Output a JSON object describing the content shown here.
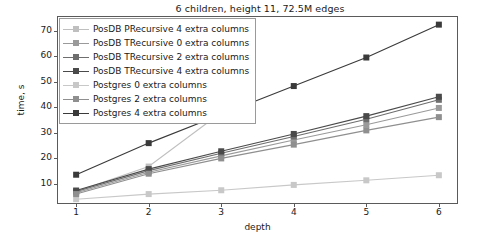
{
  "chart_data": {
    "type": "line",
    "title": "6 children, height 11, 72.5M edges",
    "xlabel": "depth",
    "ylabel": "time, s",
    "x": [
      1,
      2,
      3,
      4,
      5,
      6
    ],
    "xticklabels": [
      "1",
      "2",
      "3",
      "4",
      "5",
      "6"
    ],
    "yticklabels": [
      "10",
      "20",
      "30",
      "40",
      "50",
      "60",
      "70"
    ],
    "yticks": [
      10,
      20,
      30,
      40,
      50,
      60,
      70
    ],
    "xlim": [
      0.75,
      6.25
    ],
    "ylim": [
      2.5,
      75.5
    ],
    "grid": false,
    "legend_position": "upper left",
    "marker": "square",
    "series": [
      {
        "name": "PosDB PRecursive 4 extra columns",
        "color": "#bfbfbf",
        "values": [
          7.0,
          16.8,
          38.0,
          null,
          null,
          null
        ]
      },
      {
        "name": "PosDB TRecursive 0 extra columns",
        "color": "#9a9a9a",
        "values": [
          6.5,
          14.6,
          21.0,
          27.2,
          33.2,
          39.8
        ]
      },
      {
        "name": "PosDB TRecursive 2 extra columns",
        "color": "#6e6e6e",
        "values": [
          7.0,
          15.2,
          22.0,
          28.6,
          35.4,
          43.0
        ]
      },
      {
        "name": "PosDB TRecursive 4 extra columns",
        "color": "#4a4a4a",
        "values": [
          7.4,
          15.8,
          22.8,
          29.6,
          36.6,
          44.2
        ]
      },
      {
        "name": "Postgres 0 extra columns",
        "color": "#c8c8c8",
        "values": [
          4.0,
          6.0,
          7.5,
          9.6,
          11.4,
          13.4
        ]
      },
      {
        "name": "Postgres 2 extra columns",
        "color": "#8f8f8f",
        "values": [
          6.0,
          14.0,
          20.0,
          25.4,
          31.0,
          36.2
        ]
      },
      {
        "name": "Postgres 4 extra columns",
        "color": "#3a3a3a",
        "values": [
          13.6,
          26.0,
          37.2,
          48.4,
          59.6,
          72.5
        ]
      }
    ]
  },
  "legend": {
    "entries": [
      "PosDB PRecursive 4 extra columns",
      "PosDB TRecursive 0 extra columns",
      "PosDB TRecursive 2 extra columns",
      "PosDB TRecursive 4 extra columns",
      "Postgres 0 extra columns",
      "Postgres 2 extra columns",
      "Postgres 4 extra columns"
    ]
  }
}
